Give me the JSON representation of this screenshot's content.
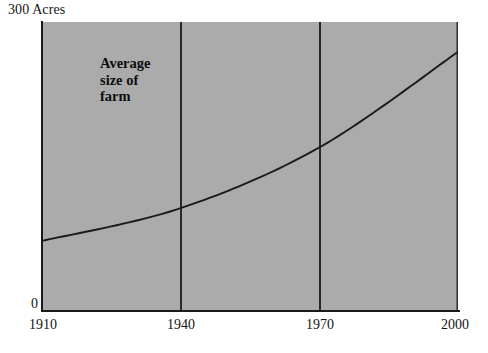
{
  "chart_data": {
    "type": "line",
    "title": "",
    "subtitle": "",
    "xlabel": "",
    "ylabel": "Acres",
    "y_axis_top_label": "300 Acres",
    "y_axis_zero_label": "0",
    "xlim": [
      1910,
      2000
    ],
    "ylim": [
      0,
      300
    ],
    "grid": true,
    "gridlines_x": [
      1940,
      1970
    ],
    "legend": "none",
    "legend_position": "none",
    "x_tick_labels": [
      "1910",
      "1940",
      "1970",
      "2000"
    ],
    "x": [
      1910,
      1940,
      1970,
      2000
    ],
    "annotations": [
      {
        "name": "series-annotation",
        "lines": [
          "Average",
          "size of",
          "farm"
        ],
        "x": 1913,
        "y": 288
      }
    ],
    "series": [
      {
        "name": "Average size of farm",
        "unit": "acres",
        "values": [
          73,
          107,
          170,
          269
        ]
      }
    ],
    "plot_background": "#ababab",
    "line_color": "#1a1a1a",
    "axis_color": "#1a1a1a"
  },
  "annotation": {
    "line1": "Average",
    "line2": "size of",
    "line3": "farm"
  },
  "axes": {
    "y_max": "300 Acres",
    "y_min": "0",
    "x_ticks": [
      "1910",
      "1940",
      "1970",
      "2000"
    ]
  }
}
